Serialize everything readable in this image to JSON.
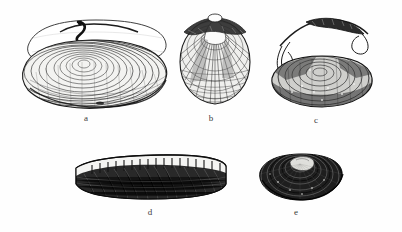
{
  "plate": {
    "title": "Bivalve shells plate",
    "background_color": "#ffffff",
    "ink_color": "#1c1c1c",
    "width": 402,
    "height": 232,
    "style": "black-and-white engraved line illustration"
  },
  "figures": [
    {
      "id": "a",
      "label": "a",
      "name": "soft-shell-clam",
      "description": "Elongated oval clam shell with fine concentric growth rings and an outlined open upper valve with a dark hooked hinge at top left",
      "orientation": "lateral view, anterior left",
      "label_x": 86,
      "label_y": 118
    },
    {
      "id": "b",
      "label": "b",
      "name": "quahog-clam",
      "description": "Rounded nearly circular clam shell with radial ribs, cross-hatched margin and a prominent umbo at the top",
      "orientation": "exterior view, umbo up",
      "label_x": 211,
      "label_y": 118
    },
    {
      "id": "c",
      "label": "c",
      "name": "oval-clam-with-siphon",
      "description": "Dark oval shell with dense concentric rings, shown below a thin curved paired siphon structure",
      "orientation": "lateral view with detached siphon above",
      "label_x": 316,
      "label_y": 120
    },
    {
      "id": "d",
      "label": "d",
      "name": "razor-clam",
      "description": "Long rectangular razor clam shell, dark body with a pale banded strip along the upper edge",
      "orientation": "lateral view, horizontal",
      "label_x": 150,
      "label_y": 212
    },
    {
      "id": "e",
      "label": "e",
      "name": "dark-oval-mussel",
      "description": "Dark rounded-oval shell with heavy concentric rings and a pale highlight near the umbo",
      "orientation": "exterior view",
      "label_x": 296,
      "label_y": 212
    }
  ]
}
